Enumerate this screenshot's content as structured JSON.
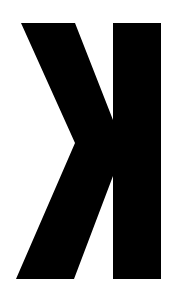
{
  "glyph": {
    "character": "ꓘ",
    "description": "Mirrored letter K",
    "fill_color": "#000000",
    "background_color": "#ffffff",
    "shapes": {
      "stem_points": "113,23 161,23 161,279 113,279",
      "arms_points": "21,23 75,23 113,120 113,176 74,279 16,279 75,143"
    }
  }
}
